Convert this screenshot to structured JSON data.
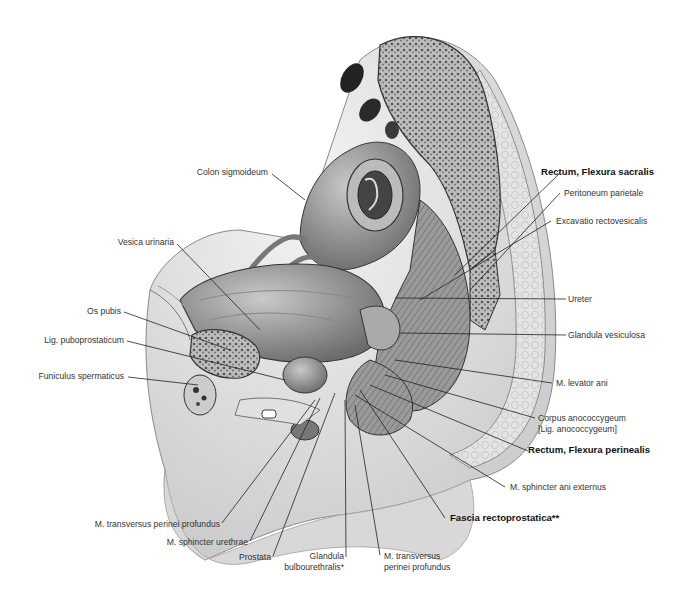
{
  "figure": {
    "labels_right": [
      {
        "id": "peritoneum-parietale",
        "text": "Peritoneum parietale",
        "bold": false
      },
      {
        "id": "rectum-flexura-sacralis",
        "text": "Rectum, Flexura sacralis",
        "bold": true
      },
      {
        "id": "excavatio-rectovesicalis",
        "text": "Excavatio rectovesicalis",
        "bold": false
      },
      {
        "id": "ureter",
        "text": "Ureter",
        "bold": false
      },
      {
        "id": "glandula-vesiculosa",
        "text": "Glandula vesiculosa",
        "bold": false
      },
      {
        "id": "m-levator-ani",
        "text": "M. levator ani",
        "bold": false
      },
      {
        "id": "corpus-anococcygeum",
        "text": "Corpus anococcygeum",
        "bold": false
      },
      {
        "id": "lig-anococcygeum",
        "text": "[Lig. anococcygeum]",
        "bold": false
      },
      {
        "id": "rectum-flexura-perinealis",
        "text": "Rectum, Flexura perinealis",
        "bold": true
      },
      {
        "id": "m-sphincter-ani-externus",
        "text": "M. sphincter ani externus",
        "bold": false
      }
    ],
    "labels_left": [
      {
        "id": "colon-sigmoideum",
        "text": "Colon sigmoideum"
      },
      {
        "id": "vesica-urinaria",
        "text": "Vesica urinaria"
      },
      {
        "id": "os-pubis",
        "text": "Os pubis"
      },
      {
        "id": "lig-puboprostaticum",
        "text": "Lig. puboprostaticum"
      },
      {
        "id": "funiculus-spermaticus",
        "text": "Funiculus spermaticus"
      }
    ],
    "labels_bottom": [
      {
        "id": "m-transversus-perinei-profundus-1",
        "text": "M. transversus perinei profundus"
      },
      {
        "id": "m-sphincter-urethrae",
        "text": "M. sphincter urethrae"
      },
      {
        "id": "prostata",
        "text": "Prostata"
      },
      {
        "id": "glandula-bulbourethralis-1",
        "text": "Glandula"
      },
      {
        "id": "glandula-bulbourethralis-2",
        "text": "bulbourethralis*"
      },
      {
        "id": "m-transversus-perinei-profundus-2a",
        "text": "M. transversus"
      },
      {
        "id": "m-transversus-perinei-profundus-2b",
        "text": "perinei profundus"
      },
      {
        "id": "fascia-rectoprostatica",
        "text": "Fascia rectoprostatica**"
      }
    ]
  }
}
